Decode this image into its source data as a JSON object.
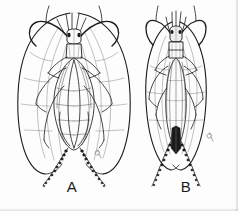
{
  "figure": {
    "background_color": "#fdfdfd",
    "ink_color": "#1b1b1b",
    "shade_color": "#6e6e6e",
    "panels": [
      {
        "id": "A",
        "label": "A",
        "label_x": 72,
        "label_y": 186,
        "description": "Broad-winged insect, dorsal view, wings spread widely outward, long curving antennae, two long segmented cerci",
        "parts": [
          {
            "name": "left-antenna",
            "note": "long curving antenna sweeping up and out to the left"
          },
          {
            "name": "right-antenna",
            "note": "long curving antenna sweeping up and out to the right"
          },
          {
            "name": "head",
            "note": "small head with eyes at top of body"
          },
          {
            "name": "pronotum",
            "note": "pale rectangular plate behind head"
          },
          {
            "name": "left-forewing",
            "note": "large elongate oval wing, outer margin broadly rounded"
          },
          {
            "name": "right-forewing",
            "note": "large elongate oval wing, mirror of left"
          },
          {
            "name": "hindwings",
            "note": "inner pair of folded wings over abdomen with venation"
          },
          {
            "name": "legs",
            "note": "three pairs of slender legs projecting sideways"
          },
          {
            "name": "left-cercus",
            "note": "long multi-segmented tail filament"
          },
          {
            "name": "right-cercus",
            "note": "long multi-segmented tail filament"
          },
          {
            "name": "artist-mark",
            "note": "small ink squiggle beside right cercus"
          }
        ]
      },
      {
        "id": "B",
        "label": "B",
        "label_x": 186,
        "label_y": 186,
        "description": "Narrow-bodied insect, dorsal view, wings closely folded along body, dark pointed abdomen tip, two long segmented cerci",
        "parts": [
          {
            "name": "left-antenna",
            "note": "long curving antenna sweeping up and out to the left"
          },
          {
            "name": "right-antenna",
            "note": "long curving antenna sweeping up and out to the right"
          },
          {
            "name": "head",
            "note": "small dark head with paired ocelli"
          },
          {
            "name": "pronotum",
            "note": "rectangular plate behind head with dark margins"
          },
          {
            "name": "left-forewing",
            "note": "narrow elongate wing closely folded, outer margin gently curved"
          },
          {
            "name": "right-forewing",
            "note": "narrow elongate wing closely folded, mirror of left"
          },
          {
            "name": "abdomen",
            "note": "striated abdomen ending in dark pointed tip"
          },
          {
            "name": "legs",
            "note": "three pairs of slender legs projecting sideways"
          },
          {
            "name": "left-cercus",
            "note": "long multi-segmented tail filament"
          },
          {
            "name": "right-cercus",
            "note": "long multi-segmented tail filament"
          },
          {
            "name": "artist-mark",
            "note": "small ink squiggle beside right cercus"
          }
        ]
      }
    ]
  }
}
